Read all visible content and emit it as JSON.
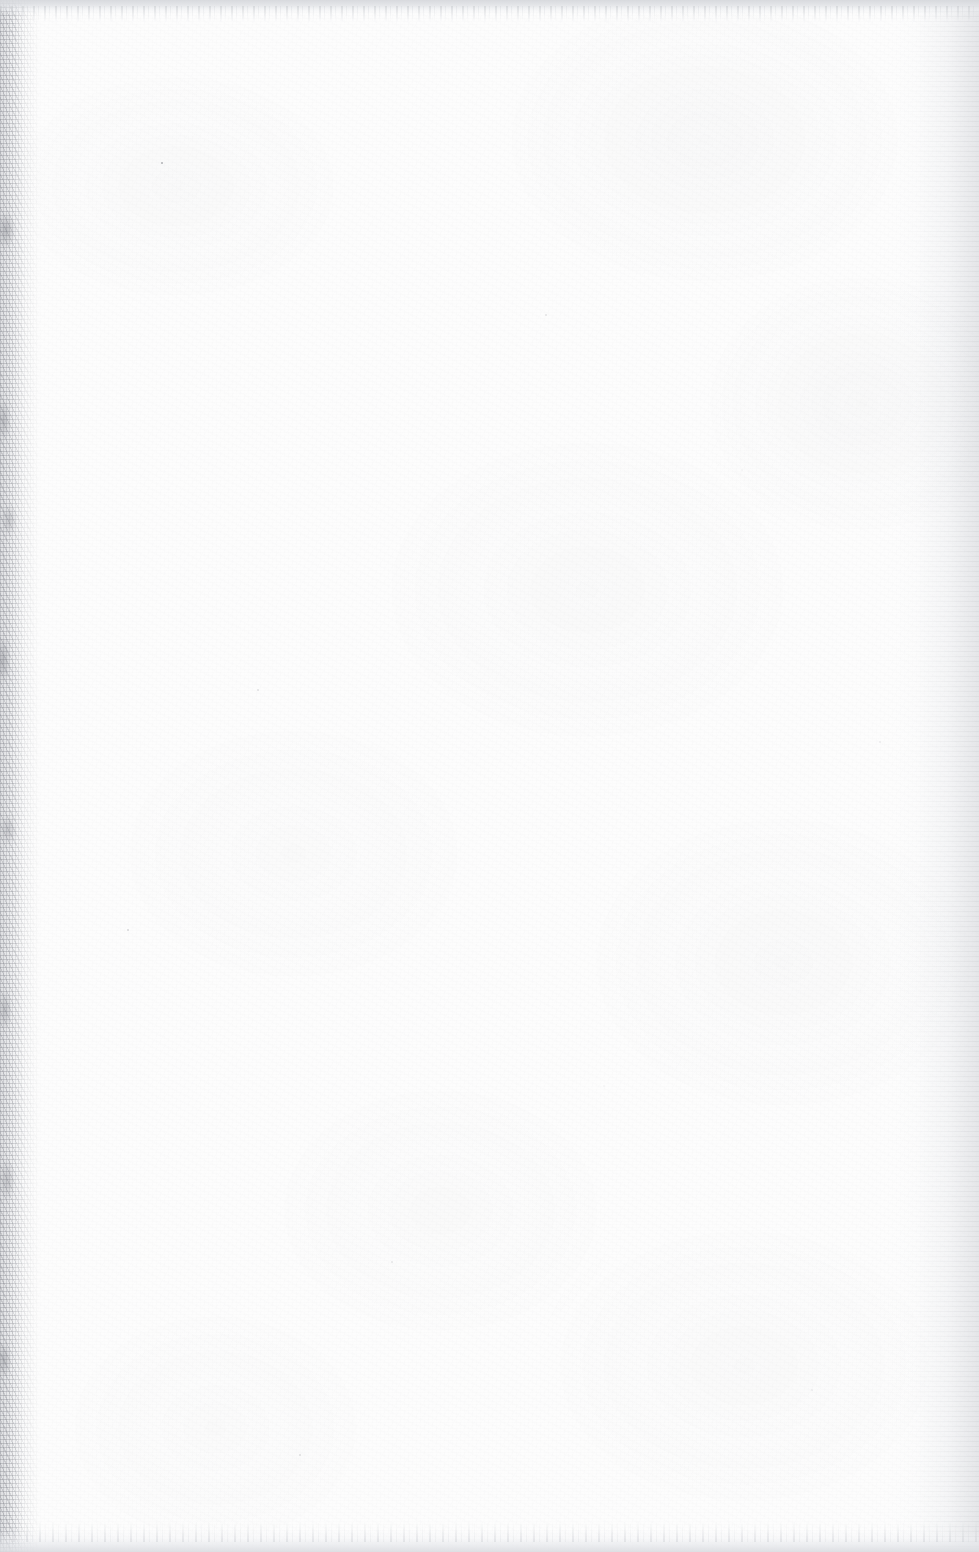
{
  "page": {
    "kind": "scanned-document-page",
    "content_state": "blank",
    "visible_text": "",
    "text_blocks": [],
    "figures": [],
    "tables": [],
    "page_number": "",
    "header_text": "",
    "footer_text": "",
    "width_px": 979,
    "height_px": 1552
  },
  "colors": {
    "paper": "#fdfdfd",
    "scanner_background": "#d6d8dc",
    "gutter_speckle": "#6e7078",
    "edge_shadow": "#cecfd3"
  },
  "artifacts": {
    "top_edge": {
      "name": "scanner-background-band",
      "position": "top",
      "height_px": 14
    },
    "bottom_edge": {
      "name": "scanner-background-band",
      "position": "bottom",
      "height_px": 22
    },
    "left_edge": {
      "name": "binding-gutter-speckle-band",
      "position": "left",
      "width_px": 34
    },
    "right_edge": {
      "name": "page-edge-shadow-gradient",
      "position": "right",
      "width_px": 90
    },
    "surface": {
      "name": "paper-grain-and-dust",
      "dust_speck_count": 10
    }
  }
}
